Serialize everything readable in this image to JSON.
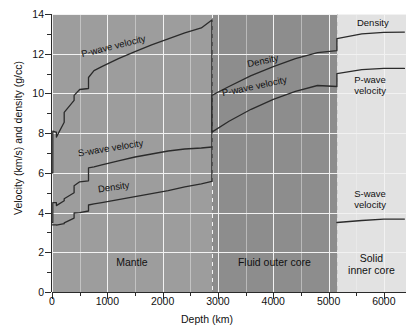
{
  "chart_data": {
    "type": "line",
    "title": "",
    "xlabel": "Depth (km)",
    "ylabel": "Velocity (km/s) and density (g/cc)",
    "xlim": [
      0,
      6400
    ],
    "ylim": [
      0,
      14
    ],
    "xticks": [
      0,
      1000,
      2000,
      3000,
      4000,
      5000,
      6000
    ],
    "xtick_labels": [
      "0",
      "1000",
      "2000",
      "3000",
      "4000",
      "5000",
      "6000"
    ],
    "yticks": [
      0,
      2,
      4,
      6,
      8,
      10,
      12,
      14
    ],
    "ytick_labels": [
      "0",
      "2",
      "4",
      "6",
      "8",
      "10",
      "12",
      "14"
    ],
    "xminor_step": 500,
    "yminor_step": 1,
    "grid": true,
    "grid_color": "#f2f2f2",
    "plot_bg": "#9d9d9d",
    "legend": "inline-annotations",
    "series": [
      {
        "name": "P-wave velocity",
        "color": "#2b2b2b",
        "points": [
          [
            0,
            6.0
          ],
          [
            15,
            6.0
          ],
          [
            15,
            8.1
          ],
          [
            70,
            8.05
          ],
          [
            80,
            8.05
          ],
          [
            80,
            7.8
          ],
          [
            220,
            8.55
          ],
          [
            220,
            9.05
          ],
          [
            400,
            9.65
          ],
          [
            400,
            9.9
          ],
          [
            500,
            10.2
          ],
          [
            660,
            10.25
          ],
          [
            660,
            10.8
          ],
          [
            760,
            11.15
          ],
          [
            900,
            11.35
          ],
          [
            1200,
            11.75
          ],
          [
            1500,
            12.1
          ],
          [
            1800,
            12.45
          ],
          [
            2100,
            12.75
          ],
          [
            2400,
            13.05
          ],
          [
            2700,
            13.3
          ],
          [
            2891,
            13.7
          ],
          [
            2891,
            8.05
          ],
          [
            3200,
            8.6
          ],
          [
            3600,
            9.2
          ],
          [
            4000,
            9.7
          ],
          [
            4400,
            10.1
          ],
          [
            4800,
            10.4
          ],
          [
            5150,
            10.35
          ],
          [
            5150,
            11.0
          ],
          [
            5600,
            11.2
          ],
          [
            6000,
            11.26
          ],
          [
            6371,
            11.26
          ]
        ]
      },
      {
        "name": "S-wave velocity",
        "color": "#2b2b2b",
        "points": [
          [
            0,
            3.5
          ],
          [
            15,
            3.5
          ],
          [
            15,
            4.5
          ],
          [
            80,
            4.5
          ],
          [
            80,
            4.35
          ],
          [
            220,
            4.6
          ],
          [
            220,
            4.7
          ],
          [
            400,
            5.0
          ],
          [
            400,
            5.35
          ],
          [
            500,
            5.55
          ],
          [
            660,
            5.6
          ],
          [
            660,
            6.25
          ],
          [
            760,
            6.3
          ],
          [
            900,
            6.4
          ],
          [
            1200,
            6.6
          ],
          [
            1500,
            6.8
          ],
          [
            1800,
            6.95
          ],
          [
            2100,
            7.1
          ],
          [
            2400,
            7.2
          ],
          [
            2700,
            7.25
          ],
          [
            2891,
            7.3
          ],
          [
            2891,
            0
          ],
          [
            5150,
            0
          ],
          [
            5150,
            3.5
          ],
          [
            5600,
            3.6
          ],
          [
            6000,
            3.67
          ],
          [
            6371,
            3.67
          ]
        ]
      },
      {
        "name": "Density",
        "color": "#2b2b2b",
        "points": [
          [
            0,
            3.38
          ],
          [
            15,
            3.38
          ],
          [
            80,
            3.38
          ],
          [
            80,
            3.37
          ],
          [
            220,
            3.44
          ],
          [
            220,
            3.48
          ],
          [
            400,
            3.72
          ],
          [
            400,
            3.98
          ],
          [
            500,
            4.0
          ],
          [
            660,
            4.08
          ],
          [
            660,
            4.38
          ],
          [
            760,
            4.44
          ],
          [
            900,
            4.5
          ],
          [
            1200,
            4.65
          ],
          [
            1500,
            4.8
          ],
          [
            1800,
            4.95
          ],
          [
            2100,
            5.1
          ],
          [
            2400,
            5.3
          ],
          [
            2700,
            5.45
          ],
          [
            2891,
            5.57
          ],
          [
            2891,
            9.9
          ],
          [
            3200,
            10.35
          ],
          [
            3600,
            10.9
          ],
          [
            4000,
            11.35
          ],
          [
            4400,
            11.75
          ],
          [
            4800,
            12.05
          ],
          [
            5150,
            12.15
          ],
          [
            5150,
            12.76
          ],
          [
            5600,
            13.0
          ],
          [
            6000,
            13.08
          ],
          [
            6371,
            13.09
          ]
        ]
      }
    ],
    "annotations": [
      {
        "text": "P-wave velocity",
        "zone": "mantle",
        "x": 1100,
        "y": 12.0,
        "rotation": -14
      },
      {
        "text": "S-wave velocity",
        "zone": "mantle",
        "x": 1050,
        "y": 7.0,
        "rotation": -9
      },
      {
        "text": "Density",
        "zone": "mantle",
        "x": 1100,
        "y": 5.2,
        "rotation": -8
      },
      {
        "text": "Density",
        "zone": "outer-core",
        "x": 3800,
        "y": 11.5,
        "rotation": -12
      },
      {
        "text": "P-wave velocity",
        "zone": "outer-core",
        "x": 3650,
        "y": 10.0,
        "rotation": -12
      },
      {
        "text": "Density",
        "zone": "inner-core",
        "x": 5800,
        "y": 13.6,
        "rotation": 0
      },
      {
        "text": "P-wave\nvelocity",
        "zone": "inner-core",
        "x": 5750,
        "y": 10.4,
        "rotation": 0
      },
      {
        "text": "S-wave\nvelocity",
        "zone": "inner-core",
        "x": 5750,
        "y": 4.7,
        "rotation": 0
      }
    ],
    "zones": [
      {
        "name": "Mantle",
        "label": "Mantle",
        "x_start": 0,
        "x_end": 2891,
        "bg": "#9d9d9d",
        "label_y": 1.3
      },
      {
        "name": "Fluid outer core",
        "label": "Fluid outer core",
        "x_start": 2891,
        "x_end": 5150,
        "bg": "#8d8d8d",
        "label_y": 1.3
      },
      {
        "name": "Solid inner core",
        "label": "Solid\ninner core",
        "x_start": 5150,
        "x_end": 6400,
        "bg": "#e2e2e2",
        "label_y": 1.5
      }
    ],
    "boundaries": [
      {
        "name": "core-mantle-boundary",
        "x": 2891,
        "style": "dashed"
      },
      {
        "name": "inner-core-boundary",
        "x": 5150,
        "style": "dashed"
      }
    ]
  }
}
